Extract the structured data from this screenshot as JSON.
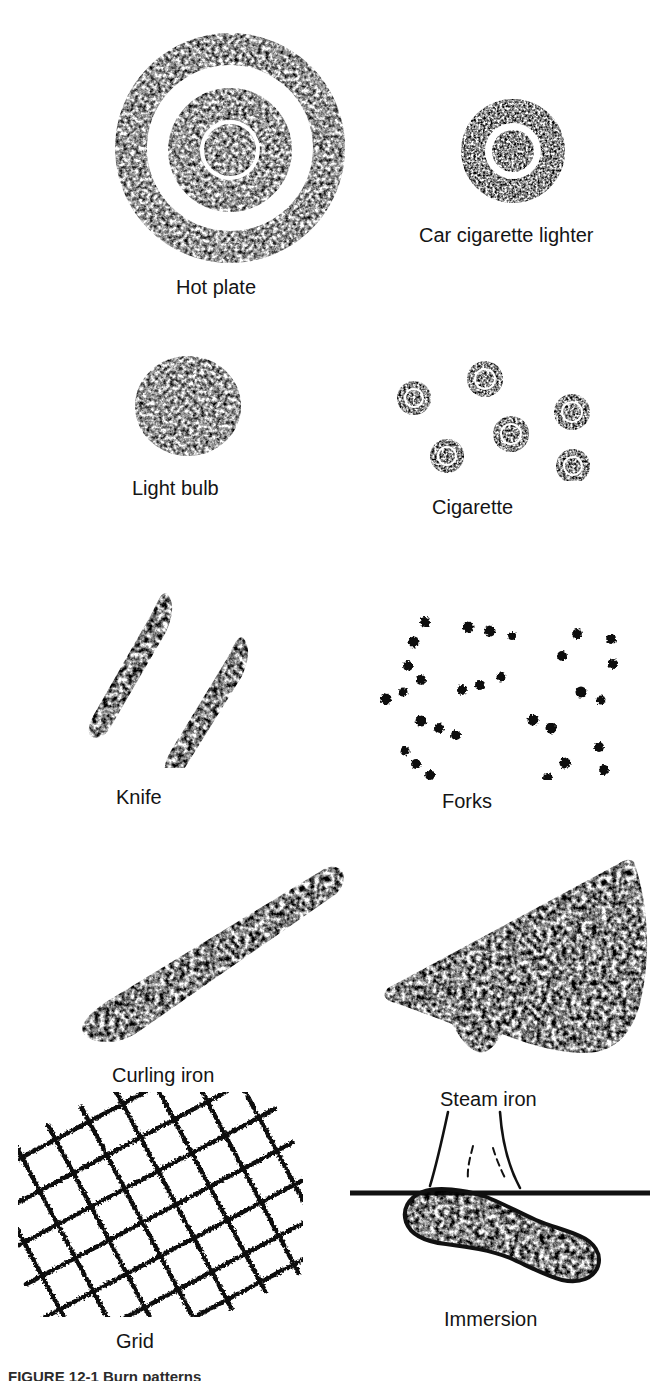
{
  "figure": {
    "caption": "FIGURE 12-1  Burn patterns",
    "background_color": "#ffffff",
    "ink_color": "#111111",
    "panels": [
      {
        "id": "hot-plate",
        "label": "Hot plate",
        "pattern": "concentric-rings",
        "ring_count": 3,
        "label_x": 230,
        "label_y": 276,
        "art_x": 85,
        "art_y": 28,
        "art_w": 290,
        "art_h": 240
      },
      {
        "id": "car-cigarette-lighter",
        "label": "Car cigarette lighter",
        "pattern": "concentric-rings",
        "ring_count": 2,
        "label_x": 525,
        "label_y": 224,
        "art_x": 443,
        "art_y": 96,
        "art_w": 140,
        "art_h": 110
      },
      {
        "id": "light-bulb",
        "label": "Light bulb",
        "pattern": "filled-disc",
        "label_x": 185,
        "label_y": 477,
        "art_x": 128,
        "art_y": 352,
        "art_w": 120,
        "art_h": 108
      },
      {
        "id": "cigarette",
        "label": "Cigarette",
        "pattern": "scattered-small-rings",
        "mark_count": 6,
        "label_x": 480,
        "label_y": 496,
        "art_x": 392,
        "art_y": 356,
        "art_w": 215,
        "art_h": 125
      },
      {
        "id": "knife",
        "label": "Knife",
        "pattern": "two-tapered-strokes",
        "label_x": 155,
        "label_y": 786,
        "art_x": 88,
        "art_y": 588,
        "art_w": 240,
        "art_h": 180
      },
      {
        "id": "forks",
        "label": "Forks",
        "pattern": "scattered-dots",
        "mark_count": 28,
        "label_x": 470,
        "label_y": 790,
        "art_x": 370,
        "art_y": 600,
        "art_w": 265,
        "art_h": 180
      },
      {
        "id": "curling-iron",
        "label": "Curling iron",
        "pattern": "tapered-wedge-stroke",
        "label_x": 160,
        "label_y": 1064,
        "art_x": 80,
        "art_y": 862,
        "art_w": 270,
        "art_h": 185
      },
      {
        "id": "steam-iron",
        "label": "Steam iron",
        "pattern": "iron-soleplate-triangle",
        "label_x": 490,
        "label_y": 1088,
        "art_x": 382,
        "art_y": 856,
        "art_w": 280,
        "art_h": 205
      },
      {
        "id": "grid",
        "label": "Grid",
        "pattern": "diagonal-mesh",
        "label_x": 140,
        "label_y": 1330,
        "art_x": 18,
        "art_y": 1092,
        "art_w": 285,
        "art_h": 225
      },
      {
        "id": "immersion",
        "label": "Immersion",
        "pattern": "foot-with-waterline",
        "label_x": 498,
        "label_y": 1308,
        "art_x": 350,
        "art_y": 1110,
        "art_w": 300,
        "art_h": 185
      }
    ]
  }
}
